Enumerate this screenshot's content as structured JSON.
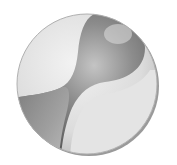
{
  "image": {
    "subject": "grayscale 3D shaded sphere emblem with dark hourglass bulb shape",
    "colors": {
      "background": "#ffffff",
      "disc_light": "#e6e6e6",
      "disc_mid": "#cfcfcf",
      "bulb_dark": "#6e6e6e",
      "bulb_mid": "#9a9a9a",
      "rim_shadow": "#8a8a8a"
    }
  }
}
